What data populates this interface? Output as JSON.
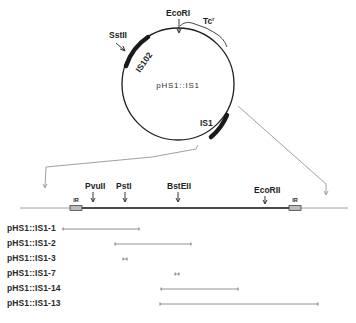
{
  "plasmid": {
    "name": "pHS1::IS1",
    "labels": {
      "ecori": "EcoRI",
      "tc": "Tc",
      "tc_sup": "r",
      "sstii": "SstII",
      "is102": "IS102",
      "is1": "IS1"
    }
  },
  "linear_map": {
    "sites": [
      {
        "name": "PvuII"
      },
      {
        "name": "PstI"
      },
      {
        "name": "BstEII"
      },
      {
        "name": "EcoRII"
      }
    ],
    "ir_left": "IR",
    "ir_right": "IR"
  },
  "deletions": [
    {
      "label": "pHS1::IS1-1",
      "start_x": 63,
      "end_x": 139
    },
    {
      "label": "pHS1::IS1-2",
      "start_x": 115,
      "end_x": 191
    },
    {
      "label": "pHS1::IS1-3",
      "start_x": 123,
      "end_x": 127
    },
    {
      "label": "pHS1::IS1-7",
      "start_x": 175,
      "end_x": 179
    },
    {
      "label": "pHS1::IS1-14",
      "start_x": 161,
      "end_x": 238
    },
    {
      "label": "pHS1::IS1-13",
      "start_x": 160,
      "end_x": 318
    }
  ],
  "colors": {
    "ink": "#1e1e1e",
    "thin_line": "#888888",
    "background": "#ffffff"
  }
}
